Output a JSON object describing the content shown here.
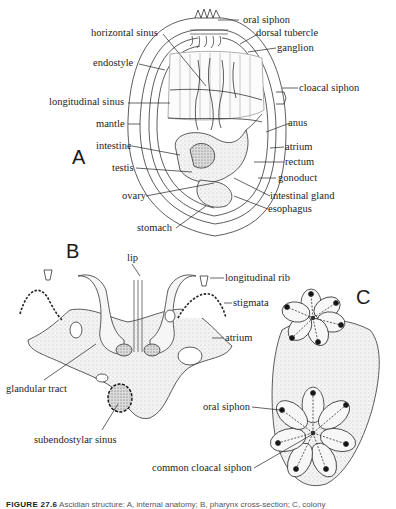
{
  "figure": {
    "panels": {
      "A": {
        "letter": "A",
        "labels": {
          "oral_siphon": "oral siphon",
          "horizontal_sinus": "horizontal sinus",
          "dorsal_tubercle": "dorsal tubercle",
          "ganglion": "ganglion",
          "endostyle": "endostyle",
          "cloacal_siphon": "cloacal siphon",
          "longitudinal_sinus": "longitudinal sinus",
          "mantle": "mantle",
          "anus": "anus",
          "atrium": "atrium",
          "intestine": "intestine",
          "rectum": "rectum",
          "testis": "testis",
          "gonoduct": "gonoduct",
          "ovary": "ovary",
          "intestinal_gland": "intestinal gland",
          "esophagus": "esophagus",
          "stomach": "stomach"
        }
      },
      "B": {
        "letter": "B",
        "labels": {
          "lip": "lip",
          "longitudinal_rib": "longitudinal rib",
          "stigmata": "stigmata",
          "atrium": "atrium",
          "glandular_tract": "glandular tract",
          "subendostylar_sinus": "subendostylar sinus"
        }
      },
      "C": {
        "letter": "C",
        "labels": {
          "oral_siphon": "oral siphon",
          "common_cloacal_siphon": "common cloacal siphon"
        }
      }
    },
    "caption": {
      "number": "FIGURE 27.6",
      "text": "Ascidian structure: A, internal anatomy; B, pharynx cross-section; C, colony"
    }
  }
}
